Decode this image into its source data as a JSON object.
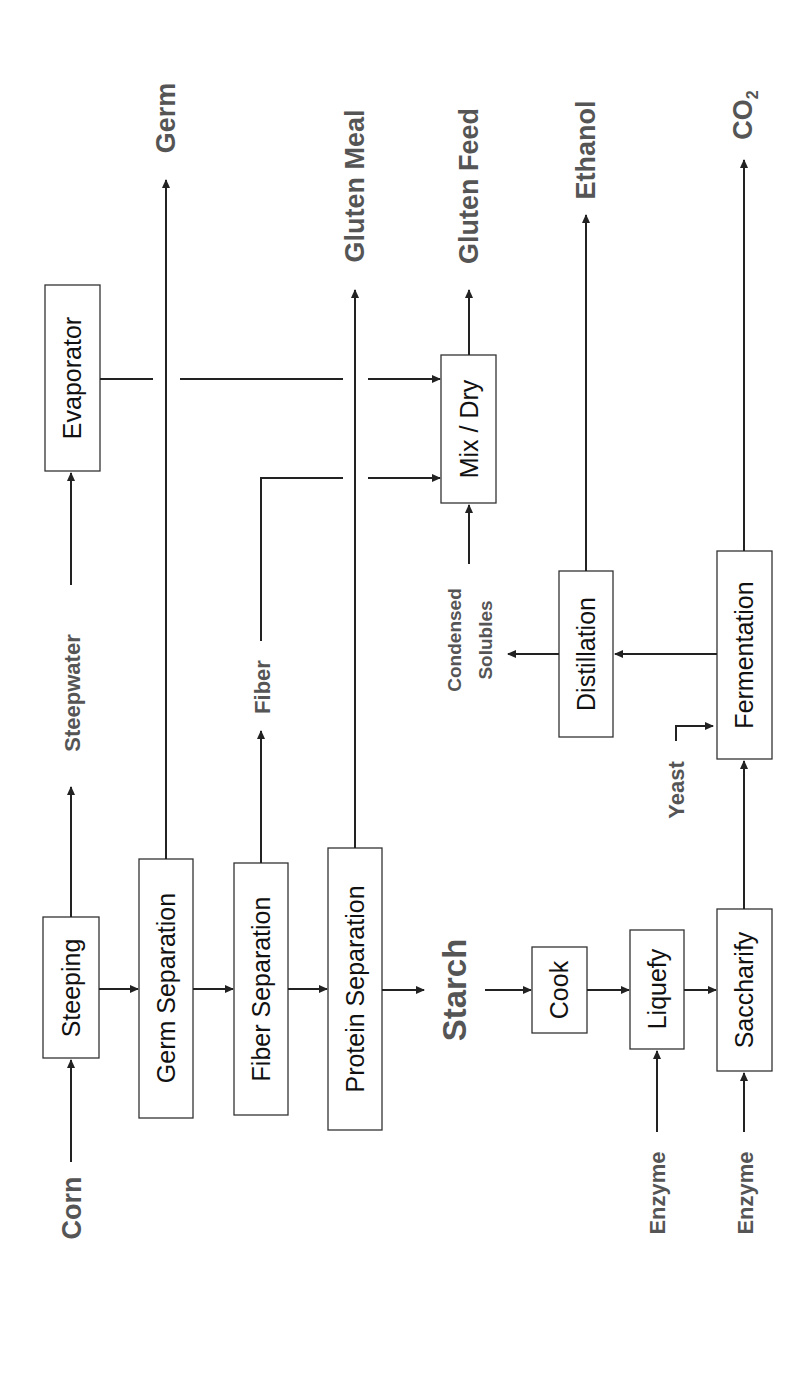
{
  "diagram": {
    "orientation": "rotated 90 degrees counter-clockwise",
    "inputs": {
      "corn": "Corn",
      "enzyme_1": "Enzyme",
      "enzyme_2": "Enzyme",
      "yeast": "Yeast"
    },
    "process_boxes": {
      "steeping": "Steeping",
      "germ_separation": "Germ Separation",
      "fiber_separation": "Fiber Separation",
      "protein_separation": "Protein Separation",
      "evaporator": "Evaporator",
      "mix_dry": "Mix / Dry",
      "cook": "Cook",
      "liquefy": "Liquefy",
      "saccharify": "Saccharify",
      "fermentation": "Fermentation",
      "distillation": "Distillation"
    },
    "intermediates": {
      "steepwater": "Steepwater",
      "fiber": "Fiber",
      "starch": "Starch",
      "condensed_solubles_line1": "Condensed",
      "condensed_solubles_line2": "Solubles"
    },
    "outputs": {
      "germ": "Germ",
      "gluten_meal": "Gluten Meal",
      "gluten_feed": "Gluten Feed",
      "ethanol": "Ethanol",
      "co2_main": "CO",
      "co2_sub": "2"
    },
    "colors": {
      "box_stroke": "#333333",
      "line": "#222222",
      "label_text": "#555555",
      "box_text": "#111111",
      "background": "#ffffff"
    }
  }
}
